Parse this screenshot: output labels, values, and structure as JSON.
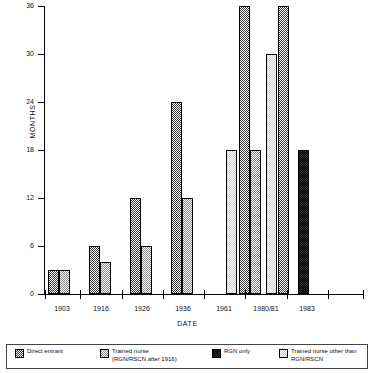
{
  "chart_data": {
    "type": "bar",
    "title": "",
    "xlabel": "DATE",
    "ylabel": "MONTHS",
    "ylim": [
      0,
      36
    ],
    "yticks": [
      0,
      6,
      12,
      18,
      24,
      30,
      36
    ],
    "grid": false,
    "legend_position": "bottom",
    "categories": [
      "1903",
      "1916",
      "1926",
      "1936",
      "1961",
      "1980/81",
      "1983"
    ],
    "series": [
      {
        "name": "Direct entrant",
        "pattern": "dark-checker",
        "color": "#3a3a3a",
        "values": [
          3,
          6,
          12,
          24,
          null,
          36,
          null
        ]
      },
      {
        "name": "Trained nurse\n(RGN/RSCN after 1916)",
        "pattern": "medium-checker",
        "color": "#8a8a8a",
        "values": [
          3,
          4,
          6,
          12,
          null,
          18,
          null
        ]
      },
      {
        "name": "RGN only",
        "pattern": "solid-black",
        "color": "#141414",
        "values": [
          null,
          null,
          null,
          null,
          null,
          36,
          18
        ]
      },
      {
        "name": "Trained nurse other than\nRGN/RSCN",
        "pattern": "light-checker",
        "color": "#cfcfcf",
        "values": [
          null,
          null,
          null,
          null,
          18,
          30,
          null
        ]
      }
    ],
    "bars": [
      {
        "group": "1903",
        "series": "Direct entrant",
        "value": 3,
        "x": 48,
        "w": 11,
        "pattern": "pat-direct"
      },
      {
        "group": "1903",
        "series": "Trained nurse (RGN/RSCN after 1916)",
        "value": 3,
        "x": 59,
        "w": 11,
        "pattern": "pat-trained"
      },
      {
        "group": "1916",
        "series": "Direct entrant",
        "value": 6,
        "x": 89,
        "w": 11,
        "pattern": "pat-direct"
      },
      {
        "group": "1916",
        "series": "Trained nurse (RGN/RSCN after 1916)",
        "value": 4,
        "x": 100,
        "w": 11,
        "pattern": "pat-trained"
      },
      {
        "group": "1926",
        "series": "Direct entrant",
        "value": 12,
        "x": 130,
        "w": 11,
        "pattern": "pat-direct"
      },
      {
        "group": "1926",
        "series": "Trained nurse (RGN/RSCN after 1916)",
        "value": 6,
        "x": 141,
        "w": 11,
        "pattern": "pat-trained"
      },
      {
        "group": "1936",
        "series": "Direct entrant",
        "value": 24,
        "x": 171,
        "w": 11,
        "pattern": "pat-direct"
      },
      {
        "group": "1936",
        "series": "Trained nurse (RGN/RSCN after 1916)",
        "value": 12,
        "x": 182,
        "w": 11,
        "pattern": "pat-trained"
      },
      {
        "group": "1961",
        "series": "Trained nurse other than RGN/RSCN",
        "value": 18,
        "x": 226,
        "w": 11,
        "pattern": "pat-other"
      },
      {
        "group": "1980/81",
        "series": "Direct entrant",
        "value": 36,
        "x": 239,
        "w": 11,
        "pattern": "pat-direct"
      },
      {
        "group": "1980/81",
        "series": "Trained nurse (RGN/RSCN after 1916)",
        "value": 18,
        "x": 250,
        "w": 11,
        "pattern": "pat-trained"
      },
      {
        "group": "1980/81",
        "series": "Trained nurse other than RGN/RSCN",
        "value": 30,
        "x": 266,
        "w": 11,
        "pattern": "pat-other"
      },
      {
        "group": "1980/81",
        "series": "Direct entrant",
        "value": 36,
        "x": 278,
        "w": 11,
        "pattern": "pat-direct"
      },
      {
        "group": "1983",
        "series": "RGN only",
        "value": 18,
        "x": 298,
        "w": 11,
        "pattern": "pat-rgn"
      }
    ],
    "xticks_px": [
      45,
      80,
      122,
      163,
      204,
      245,
      287,
      328,
      363
    ],
    "xtick_labels_px": [
      {
        "label": "1903",
        "x": 62
      },
      {
        "label": "1916",
        "x": 101
      },
      {
        "label": "1926",
        "x": 142
      },
      {
        "label": "1936",
        "x": 183
      },
      {
        "label": "1961",
        "x": 224
      },
      {
        "label": "1980/81",
        "x": 266
      },
      {
        "label": "1983",
        "x": 307
      }
    ]
  },
  "legend": {
    "items": [
      {
        "label": "Direct entrant",
        "pattern": "pat-direct",
        "x": 8,
        "w": 78
      },
      {
        "label": "Trained nurse\n(RGN/RSCN after 1916)",
        "pattern": "pat-trained",
        "x": 93,
        "w": 105
      },
      {
        "label": "RGN only",
        "pattern": "pat-rgn",
        "x": 205,
        "w": 60
      },
      {
        "label": "Trained nurse other than\nRGN/RSCN",
        "pattern": "pat-other",
        "x": 272,
        "w": 95
      }
    ]
  }
}
